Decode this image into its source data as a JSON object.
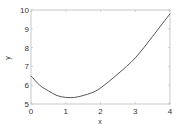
{
  "chart_data": {
    "type": "line",
    "title": "",
    "xlabel": "x",
    "ylabel": "y",
    "xlim": [
      0,
      4
    ],
    "ylim": [
      5,
      10
    ],
    "xticks": [
      0,
      1,
      2,
      3,
      4
    ],
    "yticks": [
      5,
      6,
      7,
      8,
      9,
      10
    ],
    "grid": false,
    "legend": null,
    "series": [
      {
        "name": "y",
        "color": "#555555",
        "x": [
          0,
          0.25,
          0.5,
          0.75,
          1,
          1.25,
          1.5,
          1.75,
          2,
          2.5,
          3,
          3.5,
          4
        ],
        "y": [
          6.5,
          6.0,
          5.7,
          5.45,
          5.35,
          5.35,
          5.45,
          5.6,
          5.85,
          6.6,
          7.45,
          8.6,
          9.8
        ]
      }
    ]
  }
}
